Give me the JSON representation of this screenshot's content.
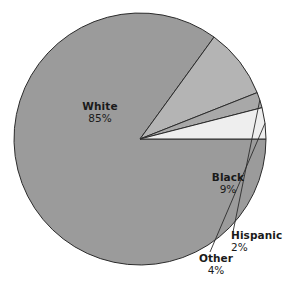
{
  "chart_data": {
    "type": "pie",
    "title": "",
    "subtitle": "",
    "xlabel": "",
    "ylabel": "",
    "legend_position": "none",
    "grid": false,
    "units": "percent",
    "categories": [
      "White",
      "Black",
      "Hispanic",
      "Other"
    ],
    "values": [
      85,
      9,
      2,
      4
    ],
    "slices": [
      {
        "label": "White",
        "value": 85,
        "value_text": "85%",
        "color": "#9b9b9b",
        "label_placement": "inside",
        "has_leader_line": false
      },
      {
        "label": "Black",
        "value": 9,
        "value_text": "9%",
        "color": "#b4b4b4",
        "label_placement": "inside",
        "has_leader_line": false
      },
      {
        "label": "Hispanic",
        "value": 2,
        "value_text": "2%",
        "color": "#a8a8a8",
        "label_placement": "outside",
        "has_leader_line": true
      },
      {
        "label": "Other",
        "value": 4,
        "value_text": "4%",
        "color": "#eeeeee",
        "label_placement": "outside",
        "has_leader_line": true
      }
    ]
  },
  "figure": {
    "background_color": "#ffffff",
    "outline_color": "#2b2b2b",
    "text_color": "#1a1a1a",
    "center_x": 140,
    "center_y": 139,
    "radius": 126,
    "start_angle_deg": 0
  },
  "labels": {
    "white": {
      "name": "White",
      "value": "85%"
    },
    "black": {
      "name": "Black",
      "value": "9%"
    },
    "hispanic": {
      "name": "Hispanic",
      "value": "2%"
    },
    "other": {
      "name": "Other",
      "value": "4%"
    }
  }
}
